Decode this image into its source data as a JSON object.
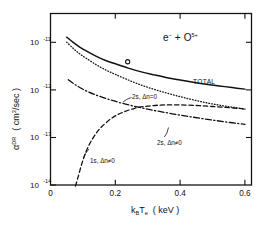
{
  "figure": {
    "background": "#ffffff",
    "ink_color": "#111111"
  },
  "chart_data": {
    "type": "line",
    "title": "",
    "annotation": "e− + O5+",
    "reaction": {
      "electron": "e",
      "electron_charge": "−",
      "plus": "+",
      "ion": "O",
      "ion_charge": "5+"
    },
    "xlabel": "k_B T_e  ( keV )",
    "xlabel_parts": {
      "k": "k",
      "B": "B",
      "T": "T",
      "e": "e",
      "units": "( keV )"
    },
    "ylabel": "α^DR  ( cm^3/sec )",
    "ylabel_parts": {
      "alpha": "α",
      "superscript": "DR",
      "units_open": "( cm",
      "units_exp": "3",
      "units_close": "/sec )"
    },
    "xscale": "linear",
    "yscale": "log",
    "xlim": [
      0,
      0.62
    ],
    "ylim": [
      1e-14,
      3.2e-11
    ],
    "xticks": [
      0,
      0.2,
      0.4,
      0.6
    ],
    "xticklabels": [
      "0",
      "0.2",
      "0.4",
      "0.6"
    ],
    "yticks": [
      1e-11,
      1e-12,
      1e-13,
      1e-14
    ],
    "yticklabels": [
      "10",
      "10",
      "10",
      "10"
    ],
    "ytick_exponents": [
      "-11",
      "-12",
      "-13",
      "-14"
    ],
    "grid": false,
    "legend_position": "inline-labels",
    "series": [
      {
        "name": "TOTAL",
        "label": "TOTAL",
        "style": "solid",
        "label_x": 0.455,
        "label_y": 1.35e-12,
        "x": [
          0.05,
          0.07,
          0.09,
          0.11,
          0.14,
          0.17,
          0.2,
          0.24,
          0.28,
          0.32,
          0.36,
          0.4,
          0.44,
          0.48,
          0.52,
          0.56,
          0.6
        ],
        "y": [
          1.05e-11,
          8.2e-12,
          6.6e-12,
          5.5e-12,
          4.3e-12,
          3.5e-12,
          3e-12,
          2.45e-12,
          2.05e-12,
          1.78e-12,
          1.56e-12,
          1.4e-12,
          1.26e-12,
          1.15e-12,
          1.06e-12,
          9.8e-13,
          9.1e-13
        ]
      },
      {
        "name": "2s-dn0",
        "label": "2s, Δn=0",
        "style": "dotted",
        "label_x": 0.225,
        "label_y": 1.05e-12,
        "x": [
          0.05,
          0.07,
          0.09,
          0.11,
          0.14,
          0.17,
          0.2,
          0.24,
          0.28,
          0.32,
          0.36,
          0.4,
          0.44,
          0.48,
          0.52,
          0.56,
          0.6
        ],
        "y": [
          8.3e-12,
          6.2e-12,
          4.8e-12,
          3.9e-12,
          2.9e-12,
          2.25e-12,
          1.82e-12,
          1.4e-12,
          1.1e-12,
          9e-13,
          7.5e-13,
          6.4e-13,
          5.5e-13,
          4.8e-13,
          4.3e-13,
          3.9e-13,
          3.55e-13
        ]
      },
      {
        "name": "2s-dn-ne-0",
        "label": "2s, Δn≠0",
        "style": "dashdot",
        "label_x": 0.385,
        "label_y": 1.35e-13,
        "x": [
          0.055,
          0.08,
          0.11,
          0.14,
          0.18,
          0.22,
          0.26,
          0.3,
          0.34,
          0.38,
          0.42,
          0.46,
          0.5,
          0.54,
          0.58,
          0.6
        ],
        "y": [
          1.42e-12,
          1.08e-12,
          8.4e-13,
          6.9e-13,
          5.6e-13,
          4.7e-13,
          4.05e-13,
          3.55e-13,
          3.15e-13,
          2.82e-13,
          2.55e-13,
          2.32e-13,
          2.12e-13,
          1.95e-13,
          1.8e-13,
          1.74e-13
        ]
      },
      {
        "name": "1s-dn-ne-0",
        "label": "1s, Δn≠0",
        "style": "dashed",
        "label_x": 0.175,
        "label_y": 3.1e-14,
        "x": [
          0.077,
          0.085,
          0.095,
          0.105,
          0.12,
          0.14,
          0.16,
          0.19,
          0.22,
          0.26,
          0.3,
          0.34,
          0.38,
          0.42,
          0.46,
          0.5,
          0.54,
          0.58,
          0.6
        ],
        "y": [
          9.5e-15,
          1.45e-14,
          2.5e-14,
          4e-14,
          6.8e-14,
          1.12e-13,
          1.6e-13,
          2.35e-13,
          3e-13,
          3.7e-13,
          4.1e-13,
          4.3e-13,
          4.35e-13,
          4.3e-13,
          4.18e-13,
          4.02e-13,
          3.85e-13,
          3.68e-13,
          3.58e-13
        ]
      }
    ],
    "points": [
      {
        "name": "measured-point",
        "marker": "open-circle",
        "x": 0.238,
        "y": 3.3e-12
      }
    ]
  }
}
